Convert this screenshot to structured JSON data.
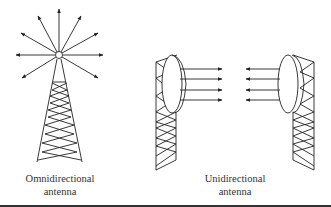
{
  "figure": {
    "omni": {
      "label_line1": "Omnidirectional",
      "label_line2": "antenna"
    },
    "uni": {
      "label_line1": "Unidirectional",
      "label_line2": "antenna"
    },
    "colors": {
      "stroke": "#222222",
      "text": "#333333",
      "background": "#ffffff"
    }
  }
}
